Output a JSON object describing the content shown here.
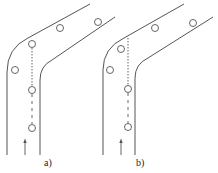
{
  "panels": [
    {
      "id": "a",
      "label": "a)"
    },
    {
      "id": "b",
      "label": "b)"
    }
  ],
  "colors": {
    "line": "#555555",
    "background": "#ffffff"
  }
}
